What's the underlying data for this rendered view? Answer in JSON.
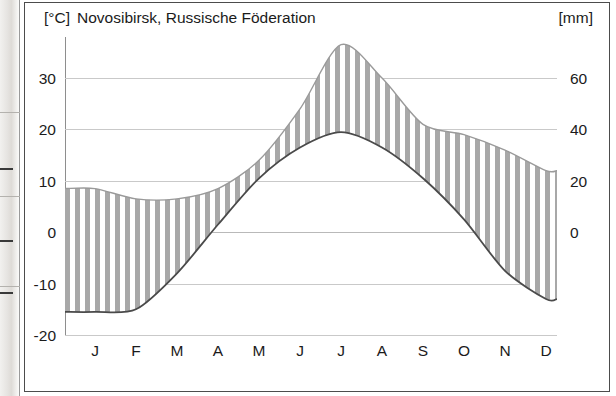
{
  "units": {
    "left": "[°C]",
    "right": "[mm]"
  },
  "title": "Novosibirsk, Russische Föderation",
  "axes": {
    "temp_ticks": [
      "30",
      "20",
      "10",
      "0",
      "-10",
      "-20"
    ],
    "precip_ticks": [
      "60",
      "40",
      "20",
      "0"
    ]
  },
  "colors": {
    "hatch": "#a8a8a8",
    "temp_line": "#4a4a4a",
    "precip_line": "#9a9a9a",
    "grid": "#c9c9c9",
    "frame": "#4c4c4c",
    "text": "#1b1b1b"
  },
  "chart_data": {
    "type": "line",
    "title": "Novosibirsk, Russische Föderation",
    "xlabel": "",
    "categories": [
      "J",
      "F",
      "M",
      "A",
      "M",
      "J",
      "J",
      "A",
      "S",
      "O",
      "N",
      "D"
    ],
    "grid": true,
    "legend": "none",
    "series": [
      {
        "name": "Temperatur",
        "unit": "°C",
        "axis": "left",
        "ylim": [
          -20,
          38
        ],
        "yticks": [
          -20,
          -10,
          0,
          10,
          20,
          30
        ],
        "values": [
          -15.5,
          -15.0,
          -8.0,
          1.5,
          10.5,
          16.5,
          19.5,
          16.5,
          10.5,
          2.5,
          -7.5,
          -13.0
        ]
      },
      {
        "name": "Niederschlag",
        "unit": "mm",
        "axis": "right",
        "ylim": [
          0,
          76
        ],
        "yticks": [
          0,
          20,
          40,
          60
        ],
        "values": [
          17,
          13,
          13,
          17,
          28,
          48,
          73,
          60,
          42,
          38,
          32,
          24
        ]
      }
    ]
  }
}
